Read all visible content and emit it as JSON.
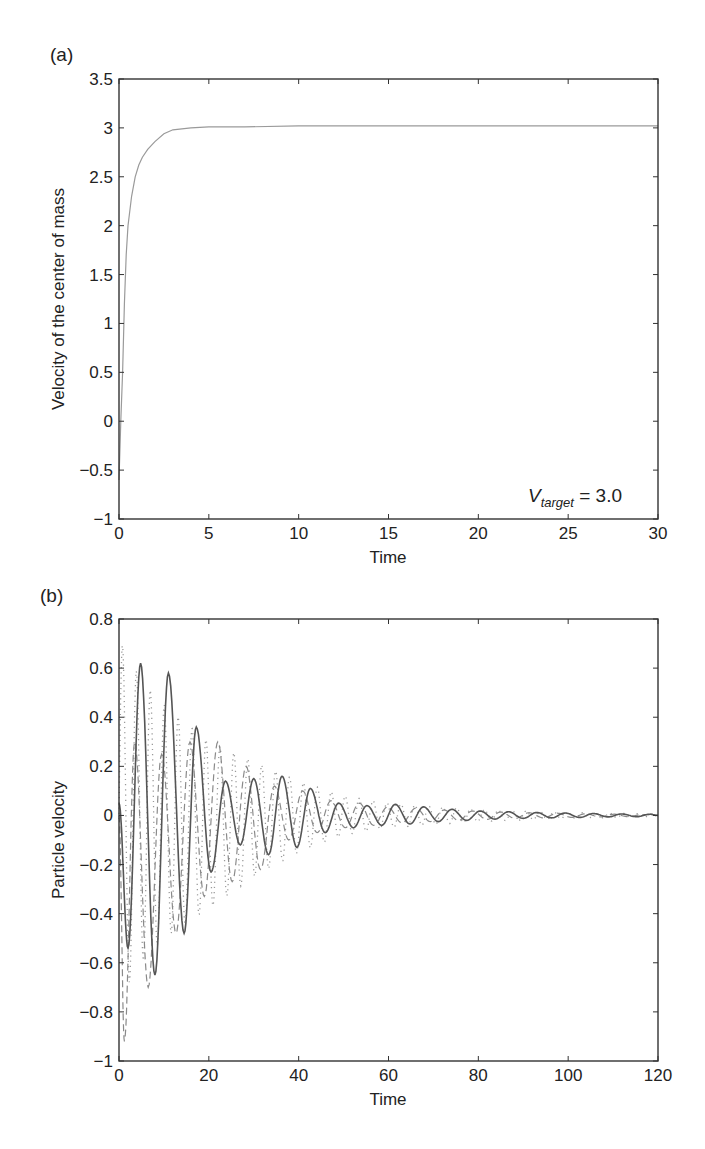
{
  "panels": {
    "a": {
      "label": "(a)"
    },
    "b": {
      "label": "(b)"
    }
  },
  "chart_data": [
    {
      "type": "line",
      "panel": "(a)",
      "title": "",
      "xlabel": "Time",
      "ylabel": "Velocity of the center of mass",
      "xlim": [
        0,
        30
      ],
      "ylim": [
        -1,
        3.5
      ],
      "xticks": [
        0,
        5,
        10,
        15,
        20,
        25,
        30
      ],
      "yticks": [
        -1,
        -0.5,
        0,
        0.5,
        1,
        1.5,
        2,
        2.5,
        3,
        3.5
      ],
      "xtick_labels": [
        "0",
        "5",
        "10",
        "15",
        "20",
        "25",
        "30"
      ],
      "ytick_labels": [
        "−1",
        "−0.5",
        "0",
        "0.5",
        "1",
        "1.5",
        "2",
        "2.5",
        "3",
        "3.5"
      ],
      "grid": false,
      "annotation": {
        "text_main": "V",
        "text_sub": "target",
        "text_rest": " = 3.0"
      },
      "series": [
        {
          "name": "center-of-mass velocity",
          "style": "solid",
          "color": "#9a9a9a",
          "x": [
            0,
            0.1,
            0.2,
            0.3,
            0.4,
            0.5,
            0.7,
            0.9,
            1.1,
            1.3,
            1.6,
            2.0,
            2.5,
            3.0,
            4.0,
            5.0,
            7.0,
            10.0,
            15.0,
            20.0,
            25.0,
            30.0
          ],
          "y": [
            -0.6,
            0.0,
            0.5,
            1.2,
            1.7,
            2.0,
            2.3,
            2.5,
            2.62,
            2.7,
            2.78,
            2.86,
            2.94,
            2.98,
            3.0,
            3.01,
            3.01,
            3.02,
            3.02,
            3.02,
            3.02,
            3.02
          ]
        }
      ]
    },
    {
      "type": "line",
      "panel": "(b)",
      "title": "",
      "xlabel": "Time",
      "ylabel": "Particle velocity",
      "xlim": [
        0,
        120
      ],
      "ylim": [
        -1,
        0.8
      ],
      "xticks": [
        0,
        20,
        40,
        60,
        80,
        100,
        120
      ],
      "yticks": [
        -1,
        -0.8,
        -0.6,
        -0.4,
        -0.2,
        0,
        0.2,
        0.4,
        0.6,
        0.8
      ],
      "xtick_labels": [
        "0",
        "20",
        "40",
        "60",
        "80",
        "100",
        "120"
      ],
      "ytick_labels": [
        "−1",
        "−0.8",
        "−0.6",
        "−0.4",
        "−0.2",
        "0",
        "0.2",
        "0.4",
        "0.6",
        "0.8"
      ],
      "grid": false,
      "series": [
        {
          "name": "particle 1",
          "style": "solid",
          "color": "#555555",
          "peaks_t": [
            0,
            2,
            4.8,
            8,
            11,
            14.5,
            17.2,
            20.5,
            23.7,
            27,
            30,
            33.3,
            36.3,
            39.6,
            42.6,
            45.9,
            48.9,
            52.2,
            55.2,
            58.5,
            61.5,
            64.8,
            67.8,
            71.1,
            74.1,
            77.4,
            80.4,
            83.7,
            86.7,
            90,
            93,
            96.3,
            99.3,
            102.6,
            105.6,
            108.9,
            111.9,
            115.2,
            118.2,
            120
          ],
          "peaks_v": [
            0.05,
            -0.54,
            0.62,
            -0.65,
            0.58,
            -0.48,
            0.36,
            -0.23,
            0.14,
            -0.12,
            0.15,
            -0.16,
            0.16,
            -0.13,
            0.11,
            -0.07,
            0.05,
            -0.05,
            0.04,
            -0.04,
            0.045,
            -0.035,
            0.035,
            -0.025,
            0.025,
            -0.02,
            0.018,
            -0.015,
            0.015,
            -0.012,
            0.012,
            -0.01,
            0.01,
            -0.008,
            0.008,
            -0.006,
            0.006,
            -0.005,
            0.005,
            0.0
          ]
        },
        {
          "name": "particle 2",
          "style": "dashed",
          "color": "#8a8a8a",
          "peaks_t": [
            0,
            1.2,
            3.5,
            6.5,
            9.5,
            12.7,
            15.8,
            19,
            22,
            25.2,
            28.3,
            31.5,
            34.6,
            37.8,
            40.9,
            44.1,
            47.2,
            50.4,
            53.5,
            56.7,
            59.8,
            63,
            66.1,
            69.3,
            72.4,
            75.6,
            78.7,
            81.9,
            85,
            88.2,
            91.3,
            94.5,
            97.6,
            100.8,
            103.9,
            107.1,
            110.2,
            113.4,
            116.5,
            120
          ],
          "peaks_v": [
            0.0,
            -0.92,
            0.3,
            -0.7,
            0.25,
            -0.48,
            0.3,
            -0.33,
            0.3,
            -0.27,
            0.2,
            -0.22,
            0.12,
            -0.1,
            0.1,
            -0.07,
            0.06,
            -0.05,
            0.05,
            -0.04,
            0.035,
            -0.03,
            0.03,
            -0.025,
            0.022,
            -0.02,
            0.018,
            -0.016,
            0.014,
            -0.012,
            0.011,
            -0.01,
            0.009,
            -0.008,
            0.007,
            -0.006,
            0.005,
            -0.005,
            0.004,
            0.0
          ]
        },
        {
          "name": "particle 3",
          "style": "dotted",
          "color": "#9a9a9a",
          "envelope_upper": {
            "t": [
              0,
              5,
              10,
              20,
              30,
              40,
              50,
              60,
              80,
              100,
              120
            ],
            "v": [
              0.72,
              0.55,
              0.45,
              0.3,
              0.22,
              0.14,
              0.08,
              0.05,
              0.025,
              0.012,
              0.006
            ]
          },
          "envelope_lower": {
            "t": [
              0,
              5,
              10,
              20,
              30,
              40,
              50,
              60,
              80,
              100,
              120
            ],
            "v": [
              -0.75,
              -0.6,
              -0.5,
              -0.38,
              -0.25,
              -0.15,
              -0.08,
              -0.05,
              -0.025,
              -0.012,
              -0.006
            ]
          },
          "period": 3.1
        }
      ]
    }
  ]
}
